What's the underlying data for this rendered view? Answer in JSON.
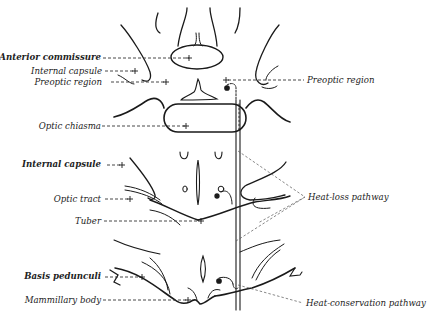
{
  "figure": {
    "type": "anatomical line drawing",
    "colors": {
      "ink": "#1a1a1a",
      "leader": "#444444",
      "background": "#ffffff"
    }
  },
  "labels": {
    "left": [
      {
        "id": "anterior-commissure",
        "text": "Anterior commissure"
      },
      {
        "id": "internal-capsule-1",
        "text": "Internal capsule"
      },
      {
        "id": "preoptic-region-left",
        "text": "Preoptic region"
      },
      {
        "id": "optic-chiasma",
        "text": "Optic chiasma"
      },
      {
        "id": "internal-capsule-2",
        "text": "Internal capsule"
      },
      {
        "id": "optic-tract",
        "text": "Optic tract"
      },
      {
        "id": "tuber",
        "text": "Tuber"
      },
      {
        "id": "basis-pedunculi",
        "text": "Basis pedunculi"
      },
      {
        "id": "mammillary-body",
        "text": "Mammillary body"
      }
    ],
    "right": [
      {
        "id": "preoptic-region-right",
        "text": "Preoptic region"
      },
      {
        "id": "heat-loss-pathway",
        "text": "Heat-loss pathway"
      },
      {
        "id": "heat-conservation-pathway",
        "text": "Heat-conservation pathway"
      }
    ]
  }
}
